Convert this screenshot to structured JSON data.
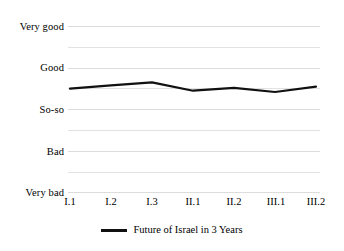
{
  "chart_data": {
    "type": "line",
    "title": "",
    "xlabel": "",
    "ylabel": "",
    "categories": [
      "I.1",
      "I.2",
      "I.3",
      "II.1",
      "II.2",
      "III.1",
      "III.2"
    ],
    "ytick_labels": [
      "Very bad",
      "Bad",
      "So-so",
      "Good",
      "Very good"
    ],
    "ytick_values": [
      1,
      2,
      3,
      4,
      5
    ],
    "ylim": [
      1,
      5
    ],
    "grid": true,
    "minor_grid": true,
    "legend_position": "bottom",
    "series": [
      {
        "name": "Future of Israel in 3 Years",
        "color": "#111111",
        "values": [
          3.5,
          3.58,
          3.65,
          3.45,
          3.52,
          3.42,
          3.55
        ]
      }
    ]
  },
  "legend": {
    "entries": [
      {
        "label": "Future of Israel in 3 Years",
        "marker": "line-marker"
      }
    ]
  }
}
